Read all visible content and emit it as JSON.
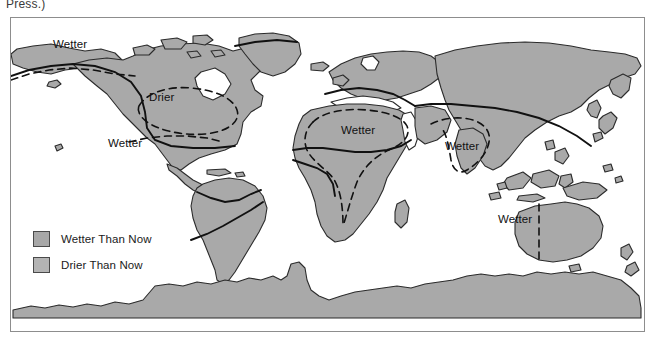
{
  "caption": {
    "tail_text": "Press.)"
  },
  "figure": {
    "name": "paleoclimate-world-map",
    "colors": {
      "wetter_fill": "#a8a8a8",
      "drier_fill": "#b4b4b4",
      "coastline": "#2b2b2b",
      "frame": "#8d8d8d",
      "contour_solid": "#111111",
      "contour_dashed": "#111111",
      "background": "#ffffff"
    }
  },
  "legend": {
    "name": "map-legend",
    "items": [
      {
        "label": "Wetter Than Now",
        "color": "#a8a8a8"
      },
      {
        "label": "Drier Than Now",
        "color": "#b4b4b4"
      }
    ]
  },
  "map_labels": [
    {
      "id": "wetter-north-pacific",
      "text": "Wetter",
      "x": 52,
      "y": 37
    },
    {
      "id": "drier-north-america",
      "text": "Drier",
      "x": 148,
      "y": 90
    },
    {
      "id": "wetter-central-america",
      "text": "Wetter",
      "x": 107,
      "y": 136
    },
    {
      "id": "wetter-north-africa",
      "text": "Wetter",
      "x": 340,
      "y": 123
    },
    {
      "id": "wetter-india",
      "text": "Wetter",
      "x": 444,
      "y": 139
    },
    {
      "id": "wetter-australia",
      "text": "Wetter",
      "x": 497,
      "y": 212
    }
  ],
  "map_regions": [
    "north-america",
    "greenland",
    "south-america",
    "africa",
    "europe",
    "asia",
    "australia",
    "antarctica",
    "southeast-asia-islands",
    "japan",
    "madagascar",
    "new-zealand",
    "british-isles",
    "arctic-islands"
  ]
}
